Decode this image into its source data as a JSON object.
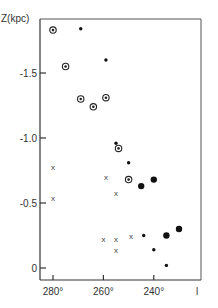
{
  "chart_data": {
    "type": "scatter",
    "title": "",
    "xlabel": "l",
    "ylabel": "Z (kpc)",
    "xlim": [
      285,
      222
    ],
    "ylim": [
      0.1,
      -1.9
    ],
    "x_ticks": [
      280,
      260,
      240
    ],
    "x_tick_labels": [
      "280°",
      "260°",
      "240°"
    ],
    "y_ticks": [
      -1.5,
      -1.0,
      -0.5,
      0
    ],
    "y_tick_labels": [
      "-1.5",
      "-1.0",
      "-0.5",
      "0"
    ],
    "grid": false,
    "legend": null,
    "series": [
      {
        "name": "circled dot",
        "marker": "circled-dot",
        "points": [
          {
            "l": 280,
            "z": -1.83
          },
          {
            "l": 275,
            "z": -1.55
          },
          {
            "l": 269,
            "z": -1.3
          },
          {
            "l": 264,
            "z": -1.24
          },
          {
            "l": 259,
            "z": -1.31
          },
          {
            "l": 254,
            "z": -0.92
          },
          {
            "l": 250,
            "z": -0.68
          }
        ]
      },
      {
        "name": "small dot",
        "marker": "small-dot",
        "points": [
          {
            "l": 269,
            "z": -1.84
          },
          {
            "l": 259,
            "z": -1.6
          },
          {
            "l": 255,
            "z": -0.96
          },
          {
            "l": 250,
            "z": -0.81
          },
          {
            "l": 244,
            "z": -0.25
          },
          {
            "l": 240,
            "z": -0.14
          },
          {
            "l": 235,
            "z": -0.02
          }
        ]
      },
      {
        "name": "large dot",
        "marker": "large-dot",
        "points": [
          {
            "l": 240,
            "z": -0.68
          },
          {
            "l": 245,
            "z": -0.63
          },
          {
            "l": 235,
            "z": -0.25
          },
          {
            "l": 230,
            "z": -0.3
          }
        ]
      },
      {
        "name": "cross",
        "marker": "x",
        "points": [
          {
            "l": 280,
            "z": -0.78
          },
          {
            "l": 280,
            "z": -0.54
          },
          {
            "l": 259,
            "z": -0.7
          },
          {
            "l": 255,
            "z": -0.58
          },
          {
            "l": 260,
            "z": -0.22
          },
          {
            "l": 255,
            "z": -0.22
          },
          {
            "l": 255,
            "z": -0.14
          },
          {
            "l": 249,
            "z": -0.25
          }
        ]
      }
    ]
  },
  "labels": {
    "y_axis_title": "Z(kpc)",
    "x_axis_title": "l"
  }
}
